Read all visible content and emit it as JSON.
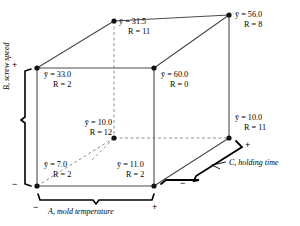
{
  "diagram": {
    "type": "cube-plot",
    "title": "",
    "factors": [
      {
        "id": "A",
        "letter": "A",
        "name": "mold temperature",
        "label": "A, mold temperature",
        "low": "−",
        "high": "+",
        "axis": "horizontal"
      },
      {
        "id": "B",
        "letter": "B",
        "name": "screw speed",
        "label": "B, screw speed",
        "low": "−",
        "high": "+",
        "axis": "vertical"
      },
      {
        "id": "C",
        "letter": "C",
        "name": "holding time",
        "label": "C, holding time",
        "low": "−",
        "high": "+",
        "axis": "depth"
      }
    ],
    "symbols": {
      "mean": "ȳ",
      "mean_prefix": "y",
      "range": "R",
      "equals": "="
    },
    "corners": [
      {
        "id": "front-bottom-left",
        "levels": {
          "A": "−",
          "B": "−",
          "C": "−"
        },
        "mean_label": "ȳ = 7.0",
        "mean_value": 7.0,
        "range_label": "R = 2",
        "range_value": 2
      },
      {
        "id": "front-bottom-right",
        "levels": {
          "A": "+",
          "B": "−",
          "C": "−"
        },
        "mean_label": "ȳ = 11.0",
        "mean_value": 11.0,
        "range_label": "R = 2",
        "range_value": 2
      },
      {
        "id": "front-top-left",
        "levels": {
          "A": "−",
          "B": "+",
          "C": "−"
        },
        "mean_label": "ȳ = 33.0",
        "mean_value": 33.0,
        "range_label": "R = 2",
        "range_value": 2
      },
      {
        "id": "front-top-right",
        "levels": {
          "A": "+",
          "B": "+",
          "C": "−"
        },
        "mean_label": "ȳ = 60.0",
        "mean_value": 60.0,
        "range_label": "R = 0",
        "range_value": 0
      },
      {
        "id": "back-bottom-left",
        "levels": {
          "A": "−",
          "B": "−",
          "C": "+"
        },
        "mean_label": "ȳ = 10.0",
        "mean_value": 10.0,
        "range_label": "R = 12",
        "range_value": 12
      },
      {
        "id": "back-bottom-right",
        "levels": {
          "A": "+",
          "B": "−",
          "C": "+"
        },
        "mean_label": "ȳ = 10.0",
        "mean_value": 10.0,
        "range_label": "R = 11",
        "range_value": 11
      },
      {
        "id": "back-top-left",
        "levels": {
          "A": "−",
          "B": "+",
          "C": "+"
        },
        "mean_label": "ȳ = 31.5",
        "mean_value": 31.5,
        "range_label": "R = 11",
        "range_value": 11
      },
      {
        "id": "back-top-right",
        "levels": {
          "A": "+",
          "B": "+",
          "C": "+"
        },
        "mean_label": "ȳ = 56.0",
        "mean_value": 56.0,
        "range_label": "R = 8",
        "range_value": 8
      }
    ],
    "signs": {
      "b_high": "+",
      "b_low": "−",
      "a_low": "−",
      "a_high": "+",
      "c_high": "+",
      "c_low": "−"
    },
    "colors": {
      "line": "#3a3a3a",
      "hidden_line": "#8a8a8a",
      "vertex": "#111111",
      "bracket": "#000000",
      "text": "#000000",
      "background": "#ffffff"
    }
  }
}
